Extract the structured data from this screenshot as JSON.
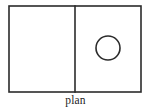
{
  "figure": {
    "caption": "plan",
    "type": "architectural-floor-plan-diagram",
    "canvas": {
      "width": 151,
      "height": 111,
      "background_color": "#ffffff"
    },
    "stroke_color": "#2b2b2b",
    "fill_color": "#ffffff",
    "outline": {
      "name": "plan-outline-rectangle",
      "x": 9,
      "y": 6,
      "width": 132,
      "height": 86
    },
    "divider": {
      "name": "interior-dividing-wall",
      "orientation": "vertical",
      "x": 75,
      "y1": 6,
      "y2": 92
    },
    "rooms": [
      {
        "name": "left-room",
        "x": 9,
        "y": 6,
        "width": 66,
        "height": 86,
        "contents": "empty"
      },
      {
        "name": "right-room",
        "x": 75,
        "y": 6,
        "width": 66,
        "height": 86,
        "contents": "circle"
      }
    ],
    "circle": {
      "name": "circular-element",
      "cx": 108,
      "cy": 48,
      "r": 12
    }
  }
}
